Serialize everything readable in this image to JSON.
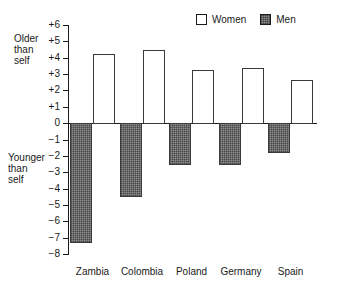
{
  "chart_data": {
    "type": "bar",
    "title": "",
    "subtitle": "",
    "xlabel": "",
    "ylabel": "",
    "categories": [
      "Zambia",
      "Colombia",
      "Poland",
      "Germany",
      "Spain"
    ],
    "series": [
      {
        "name": "Women",
        "values": [
          4.2,
          4.5,
          3.25,
          3.35,
          2.65
        ]
      },
      {
        "name": "Men",
        "values": [
          -7.3,
          -4.5,
          -2.55,
          -2.55,
          -1.8
        ]
      }
    ],
    "ylim": [
      -8,
      6
    ],
    "y_ticks": [
      6,
      5,
      4,
      3,
      2,
      1,
      0,
      -1,
      -2,
      -3,
      -4,
      -5,
      -6,
      -7,
      -8
    ],
    "y_tick_labels": [
      "+6",
      "+5",
      "+4",
      "+3",
      "+2",
      "+1",
      "0",
      "−1",
      "−2",
      "−3",
      "−4",
      "−5",
      "−6",
      "−7",
      "−8"
    ],
    "grid": false,
    "legend_position": "top-right",
    "annotations": [
      {
        "id": "older",
        "text": "Older\nthan\nself"
      },
      {
        "id": "younger",
        "text": "Younger\nthan\nself"
      }
    ],
    "colors": {
      "women_fill": "#ffffff",
      "men_fill": "#8f8f8f",
      "outline": "#3a3a3a",
      "axis": "#1a1a1a"
    }
  },
  "legend": {
    "entries": [
      {
        "label": "Women",
        "swatch": "women-swatch-icon"
      },
      {
        "label": "Men",
        "swatch": "men-swatch-icon"
      }
    ]
  }
}
